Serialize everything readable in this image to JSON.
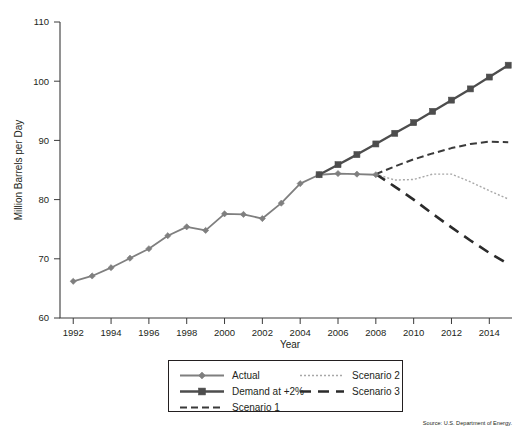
{
  "chart_data": {
    "type": "line",
    "title": "",
    "xlabel": "Year",
    "ylabel": "Million Barrels per Day",
    "xlim": [
      1991.3,
      2015.2
    ],
    "ylim": [
      60,
      110
    ],
    "yticks": [
      60,
      70,
      80,
      90,
      100,
      110
    ],
    "xticks": [
      1992,
      1994,
      1996,
      1998,
      2000,
      2002,
      2004,
      2006,
      2008,
      2010,
      2012,
      2014
    ],
    "grid": false,
    "legend_position": "below-plot",
    "source_note": "Source: U.S. Department of Energy.",
    "series": [
      {
        "name": "Actual",
        "style": "solid-diamond",
        "color": "#7f7f7f",
        "x": [
          1992,
          1993,
          1994,
          1995,
          1996,
          1997,
          1998,
          1999,
          2000,
          2001,
          2002,
          2003,
          2004,
          2005,
          2006,
          2007,
          2008
        ],
        "values": [
          66.2,
          67.1,
          68.5,
          70.1,
          71.7,
          73.9,
          75.4,
          74.8,
          77.6,
          77.5,
          76.8,
          79.4,
          82.7,
          84.2,
          84.4,
          84.3,
          84.2
        ]
      },
      {
        "name": "Demand at +2%",
        "style": "solid-square",
        "color": "#4d4d4d",
        "x": [
          2005,
          2006,
          2007,
          2008,
          2009,
          2010,
          2011,
          2012,
          2013,
          2014,
          2015
        ],
        "values": [
          84.2,
          85.9,
          87.6,
          89.4,
          91.2,
          93.0,
          94.9,
          96.8,
          98.7,
          100.7,
          102.7
        ]
      },
      {
        "name": "Scenario 1",
        "style": "dashed",
        "color": "#3a3a3a",
        "x": [
          2008,
          2009,
          2010,
          2011,
          2012,
          2013,
          2014,
          2015
        ],
        "values": [
          84.3,
          85.6,
          86.8,
          87.8,
          88.7,
          89.4,
          89.8,
          89.7
        ]
      },
      {
        "name": "Scenario 2",
        "style": "dotted-light",
        "color": "#a8a8a8",
        "x": [
          2008,
          2009,
          2010,
          2011,
          2012,
          2013,
          2014,
          2015
        ],
        "values": [
          84.3,
          83.3,
          83.4,
          84.3,
          84.3,
          83.0,
          81.5,
          80.1
        ]
      },
      {
        "name": "Scenario 3",
        "style": "long-dash",
        "color": "#2b2b2b",
        "x": [
          2008,
          2009,
          2010,
          2011,
          2012,
          2013,
          2014,
          2015
        ],
        "values": [
          84.3,
          82.2,
          80.0,
          77.6,
          75.3,
          73.1,
          71.0,
          69.1
        ]
      }
    ]
  },
  "axis": {
    "ylabel": "Million Barrels per Day",
    "xlabel": "Year",
    "ytick_labels": [
      "110",
      "100",
      "90",
      "80",
      "70",
      "60"
    ],
    "xtick_labels": [
      "1992",
      "1994",
      "1996",
      "1998",
      "2000",
      "2002",
      "2004",
      "2006",
      "2008",
      "2010",
      "2012",
      "2014"
    ]
  },
  "legend": {
    "items": [
      {
        "label": "Actual",
        "swatch": "solid-diamond",
        "color": "#7f7f7f"
      },
      {
        "label": "Demand at +2%",
        "swatch": "solid-square",
        "color": "#4d4d4d"
      },
      {
        "label": "Scenario 1",
        "swatch": "dashed",
        "color": "#3a3a3a"
      },
      {
        "label": "Scenario 2",
        "swatch": "dotted-light",
        "color": "#a8a8a8"
      },
      {
        "label": "Scenario 3",
        "swatch": "long-dash",
        "color": "#2b2b2b"
      }
    ]
  },
  "footer": {
    "source": "Source: U.S. Department of Energy."
  }
}
